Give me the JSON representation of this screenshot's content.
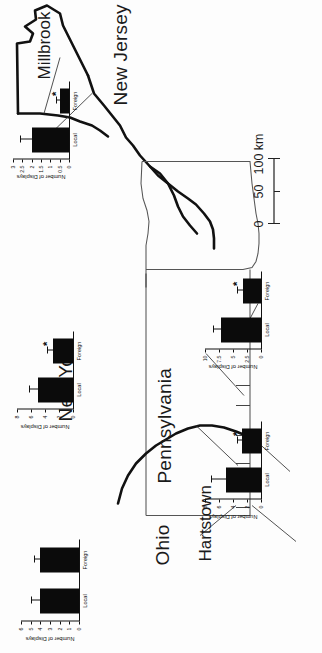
{
  "figure": {
    "type": "map-with-inset-barcharts",
    "orientation": "rotated-90-ccw",
    "background": "#ffffff",
    "bar_color": "#0b0b0b"
  },
  "map": {
    "states": [
      {
        "name": "New York"
      },
      {
        "name": "Pennsylvania"
      },
      {
        "name": "New Jersey"
      },
      {
        "name": "Ohio"
      }
    ],
    "sites": [
      {
        "name": "Millbrook"
      },
      {
        "name": "Hartstown"
      }
    ],
    "scalebar": {
      "ticks": [
        "0",
        "50",
        "100 km"
      ],
      "unit": "km",
      "max": 100
    }
  },
  "chart_data": [
    {
      "id": "millbrook",
      "type": "bar",
      "title": "",
      "site": "Millbrook",
      "categories": [
        "Local",
        "Foreign"
      ],
      "values": [
        2.0,
        0.5
      ],
      "errors": [
        0.6,
        0.18
      ],
      "significance": [
        "",
        "*"
      ],
      "xlabel": "",
      "ylabel": "Number of Displays",
      "ylim": [
        0,
        3
      ],
      "yticks": [
        "0",
        "0.5",
        "1",
        "1.5",
        "2",
        "2.5",
        "3"
      ],
      "ytickvals": [
        0,
        0.5,
        1,
        1.5,
        2,
        2.5,
        3
      ],
      "grid": false,
      "legend": "none"
    },
    {
      "id": "new-york",
      "type": "bar",
      "title": "",
      "site": "New York",
      "categories": [
        "Local",
        "Foreign"
      ],
      "values": [
        5.0,
        2.8
      ],
      "errors": [
        1.3,
        0.9
      ],
      "significance": [
        "",
        "*"
      ],
      "xlabel": "",
      "ylabel": "Number of Displays",
      "ylim": [
        0,
        8
      ],
      "yticks": [
        "0",
        "2",
        "4",
        "6",
        "8"
      ],
      "ytickvals": [
        0,
        2,
        4,
        6,
        8
      ],
      "grid": false,
      "legend": "none"
    },
    {
      "id": "pennsylvania",
      "type": "bar",
      "title": "",
      "site": "Pennsylvania",
      "categories": [
        "Local",
        "Foreign"
      ],
      "values": [
        7.2,
        3.3
      ],
      "errors": [
        1.4,
        0.9
      ],
      "significance": [
        "",
        "*"
      ],
      "xlabel": "",
      "ylabel": "Number of Displays",
      "ylim": [
        0,
        10
      ],
      "yticks": [
        "0",
        "2.5",
        "5",
        "7.5",
        "10"
      ],
      "ytickvals": [
        0,
        2.5,
        5,
        7.5,
        10
      ],
      "grid": false,
      "legend": "none"
    },
    {
      "id": "hartstown",
      "type": "bar",
      "title": "",
      "site": "Hartstown",
      "categories": [
        "Local",
        "Foreign"
      ],
      "values": [
        5.0,
        2.7
      ],
      "errors": [
        2.1,
        0.8
      ],
      "significance": [
        "",
        "*"
      ],
      "xlabel": "",
      "ylabel": "Number of Displays",
      "ylim": [
        0,
        8
      ],
      "yticks": [
        "0",
        "2",
        "4",
        "6",
        "8"
      ],
      "ytickvals": [
        0,
        2,
        4,
        6,
        8
      ],
      "grid": false,
      "legend": "none"
    },
    {
      "id": "ohio",
      "type": "bar",
      "title": "",
      "site": "Ohio",
      "categories": [
        "Local",
        "Foreign"
      ],
      "values": [
        4.0,
        4.0
      ],
      "errors": [
        1.0,
        0.7
      ],
      "significance": [
        "",
        ""
      ],
      "xlabel": "",
      "ylabel": "Number of Displays",
      "ylim": [
        0,
        6
      ],
      "yticks": [
        "0",
        "1",
        "2",
        "3",
        "4",
        "5",
        "6"
      ],
      "ytickvals": [
        0,
        1,
        2,
        3,
        4,
        5,
        6
      ],
      "grid": false,
      "legend": "none"
    }
  ]
}
